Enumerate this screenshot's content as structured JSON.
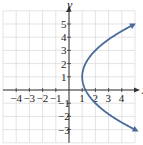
{
  "chart_data": {
    "type": "line",
    "title": "",
    "equation": "x = (y - 1)^2 / 4 + 1",
    "xlabel": "x",
    "ylabel": "y",
    "xlim": [
      -5,
      5
    ],
    "ylim": [
      -4,
      6
    ],
    "grid": true,
    "x_ticks": [
      -4,
      -3,
      -2,
      -1,
      1,
      2,
      3,
      4
    ],
    "y_ticks": [
      -3,
      -2,
      -1,
      1,
      2,
      3,
      4,
      5
    ],
    "x_tick_labels": [
      "-4",
      "-3",
      "-2",
      "-1",
      "1",
      "2",
      "3",
      "4"
    ],
    "y_tick_labels": [
      "-3",
      "-2",
      "-1",
      "1",
      "2",
      "3",
      "4",
      "5"
    ],
    "vertex": [
      1,
      1
    ],
    "series": [
      {
        "name": "parabola",
        "color": "#4a6a9a",
        "points": [
          [
            5,
            -3
          ],
          [
            4,
            -2.46
          ],
          [
            3,
            -1.83
          ],
          [
            2,
            -1
          ],
          [
            1.25,
            0
          ],
          [
            1,
            1
          ],
          [
            1.25,
            2
          ],
          [
            2,
            3
          ],
          [
            3,
            3.83
          ],
          [
            4,
            4.46
          ],
          [
            4.8,
            4.9
          ]
        ],
        "arrows": "both"
      }
    ]
  },
  "axes": {
    "x_label": "x",
    "y_label": "y"
  }
}
